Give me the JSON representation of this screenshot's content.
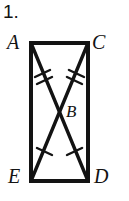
{
  "problem": {
    "number": "1."
  },
  "figure": {
    "type": "geometry-diagram",
    "shape": "rectangle-with-diagonals",
    "stroke_color": "#131313",
    "fill_color": "#ffffff",
    "background_color": "#ffffff",
    "vertices": [
      {
        "id": "A",
        "label": "A",
        "role": "top-left-corner",
        "x": 31,
        "y": 43
      },
      {
        "id": "C",
        "label": "C",
        "role": "top-right-corner",
        "x": 88,
        "y": 43
      },
      {
        "id": "D",
        "label": "D",
        "role": "bottom-right-corner",
        "x": 88,
        "y": 181
      },
      {
        "id": "E",
        "label": "E",
        "role": "bottom-left-corner",
        "x": 31,
        "y": 181
      },
      {
        "id": "B",
        "label": "B",
        "role": "diagonal-intersection",
        "x": 59,
        "y": 112
      }
    ],
    "sides": [
      "AC",
      "CD",
      "DE",
      "EA"
    ],
    "diagonals": [
      "AD",
      "CE"
    ],
    "tick_marks": [
      {
        "segment": "AB",
        "count": 2
      },
      {
        "segment": "CB",
        "count": 2
      },
      {
        "segment": "BE",
        "count": 1
      },
      {
        "segment": "BD",
        "count": 1
      }
    ]
  }
}
